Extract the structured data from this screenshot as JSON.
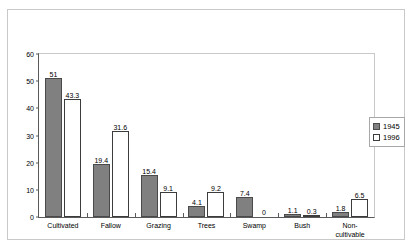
{
  "chart_data": {
    "type": "bar",
    "title": "",
    "xlabel": "",
    "ylabel": "Percent of total transects",
    "ylim": [
      0,
      60
    ],
    "yticks": [
      0,
      10,
      20,
      30,
      40,
      50,
      60
    ],
    "grid": false,
    "legend_position": "right",
    "categories": [
      "Cultivated",
      "Fallow",
      "Grazing",
      "Trees",
      "Swamp",
      "Bush",
      "Non-\ncultivable"
    ],
    "category_lines": [
      [
        "Cultivated"
      ],
      [
        "Fallow"
      ],
      [
        "Grazing"
      ],
      [
        "Trees"
      ],
      [
        "Swamp"
      ],
      [
        "Bush"
      ],
      [
        "Non-",
        "cultivable"
      ]
    ],
    "series": [
      {
        "name": "1945",
        "color": "#808080",
        "values": [
          51,
          19.4,
          15.4,
          4.1,
          7.4,
          1.1,
          1.8
        ],
        "labels": [
          "51",
          "19.4",
          "15.4",
          "4.1",
          "7.4",
          "1.1",
          "1.8"
        ]
      },
      {
        "name": "1996",
        "color": "#ffffff",
        "values": [
          43.3,
          31.6,
          9.1,
          9.2,
          0,
          0.3,
          6.5
        ],
        "labels": [
          "43.3",
          "31.6",
          "9.1",
          "9.2",
          "0",
          "0.3",
          "6.5"
        ]
      }
    ]
  },
  "legend": {
    "items": [
      {
        "label": "1945",
        "swatch": "filled-gray-swatch"
      },
      {
        "label": "1996",
        "swatch": "outlined-white-swatch"
      }
    ]
  },
  "axis": {
    "y_title": "Percent of total transects",
    "y_tick_labels": [
      "60",
      "50",
      "40",
      "30",
      "20",
      "10",
      "0"
    ]
  }
}
